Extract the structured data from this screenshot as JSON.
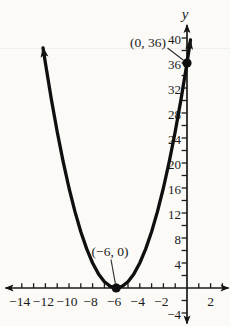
{
  "figure": {
    "background": "#fbfaf7",
    "ink": "#141414"
  },
  "axes": {
    "y_label": "y"
  },
  "annotations": {
    "vertex_label": "(−6, 0)",
    "intercept_label": "(0, 36)"
  },
  "chart_data": {
    "type": "line",
    "title": "",
    "xlabel": "",
    "ylabel": "y",
    "xlim": [
      -15.3,
      3.6
    ],
    "ylim": [
      -6.1,
      42.1
    ],
    "grid": false,
    "legend": false,
    "x_axis": {
      "tick_step": 1,
      "tick_values": [
        -14,
        -13,
        -12,
        -11,
        -10,
        -9,
        -8,
        -7,
        -6,
        -5,
        -4,
        -3,
        -2,
        -1,
        1,
        2,
        3
      ],
      "labeled_ticks": [
        {
          "value": -14,
          "label": "−14"
        },
        {
          "value": -12,
          "label": "−12"
        },
        {
          "value": -10,
          "label": "−10"
        },
        {
          "value": -8,
          "label": "−8"
        },
        {
          "value": -6,
          "label": "−6"
        },
        {
          "value": -4,
          "label": "−4"
        },
        {
          "value": -2,
          "label": "−2"
        },
        {
          "value": 2,
          "label": "2"
        }
      ]
    },
    "y_axis": {
      "tick_step": 2,
      "tick_values": [
        -4,
        -2,
        2,
        4,
        6,
        8,
        10,
        12,
        14,
        16,
        18,
        20,
        22,
        24,
        26,
        28,
        30,
        32,
        34,
        36,
        38,
        40
      ],
      "labeled_ticks": [
        {
          "value": 40,
          "label": "40"
        },
        {
          "value": 36,
          "label": "36"
        },
        {
          "value": 32,
          "label": "32"
        },
        {
          "value": 28,
          "label": "28"
        },
        {
          "value": 24,
          "label": "24"
        },
        {
          "value": 20,
          "label": "20"
        },
        {
          "value": 16,
          "label": "16"
        },
        {
          "value": 12,
          "label": "12"
        },
        {
          "value": 8,
          "label": "8"
        },
        {
          "value": 4,
          "label": "4"
        },
        {
          "value": -4,
          "label": "−4"
        }
      ]
    },
    "series": [
      {
        "name": "parabola",
        "x": [
          -12.2,
          -12,
          -11.5,
          -11,
          -10.5,
          -10,
          -9.5,
          -9,
          -8.5,
          -8,
          -7.5,
          -7,
          -6.5,
          -6,
          -5.5,
          -5,
          -4.5,
          -4,
          -3.5,
          -3,
          -2.5,
          -2,
          -1.5,
          -1,
          -0.5,
          0,
          0.3
        ],
        "y": [
          38.44,
          36,
          30.25,
          25,
          20.25,
          16,
          12.25,
          9,
          6.25,
          4,
          2.25,
          1,
          0.25,
          0,
          0.25,
          1,
          2.25,
          4,
          6.25,
          9,
          12.25,
          16,
          20.25,
          25,
          30.25,
          36,
          39.69
        ]
      }
    ],
    "labeled_points": [
      {
        "label": "(−6, 0)",
        "x": -6,
        "y": 0
      },
      {
        "label": "(0, 36)",
        "x": 0,
        "y": 36
      }
    ]
  }
}
